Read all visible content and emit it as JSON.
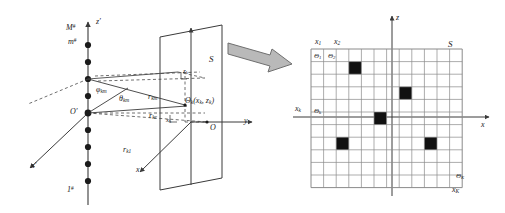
{
  "figure": {
    "background_color": "#ffffff",
    "line_color": "#3a3a3a",
    "text_color": "#1a1a1a",
    "cell_fill_color": "#111111",
    "arrow_fill_color": "#b9b9b9",
    "arrow_stroke_color": "#6f6f6f"
  },
  "left_panel": {
    "name": "array-geometry-diagram",
    "axes": [
      {
        "id": "z-prime-axis",
        "label": "z'",
        "direction": "up"
      },
      {
        "id": "x-prime-axis",
        "label": "x'",
        "direction": "down-left"
      },
      {
        "id": "y-axis",
        "label": "y",
        "direction": "right"
      },
      {
        "id": "z-axis",
        "label": "z",
        "direction": "up"
      },
      {
        "id": "x-axis",
        "label": "x",
        "direction": "down-left"
      }
    ],
    "origins": [
      {
        "id": "array-origin",
        "label": "O'"
      },
      {
        "id": "plane-origin",
        "label": "O"
      }
    ],
    "array": {
      "top_label": "M#",
      "element_label": "m#",
      "bottom_label": "1#",
      "element_count": 11
    },
    "plane_label": "S",
    "target_point_label": "Θk(xk, zk)",
    "target_point_theta": "Θ",
    "target_point_sub": "k",
    "target_point_coords": "(x",
    "angles": [
      {
        "id": "phi-km",
        "label": "φkm"
      },
      {
        "id": "theta-km",
        "label": "θkm"
      }
    ],
    "ranges": [
      {
        "id": "r-km",
        "label": "rkm"
      },
      {
        "id": "r-kc",
        "label": "rkc"
      },
      {
        "id": "r-k1",
        "label": "rk1"
      }
    ],
    "projections": [
      {
        "id": "z-k-projection",
        "label": "zk"
      },
      {
        "id": "x-k-projection",
        "label": "xk"
      }
    ]
  },
  "connector": {
    "name": "expand-arrow",
    "kind": "block-arrow",
    "direction": "down-right"
  },
  "right_panel": {
    "name": "discretized-grid-diagram",
    "grid": {
      "columns": 12,
      "rows": 11,
      "label": "S"
    },
    "axes": [
      {
        "id": "grid-z-axis",
        "label": "z",
        "direction": "up"
      },
      {
        "id": "grid-x-axis",
        "label": "x",
        "direction": "right"
      }
    ],
    "column_labels_top": [
      "x1",
      "x2"
    ],
    "column_label_bottom": "xK",
    "row_label_left": "xk",
    "cell_labels": [
      {
        "id": "theta-1",
        "label": "Θ1",
        "col": 0,
        "row": 0
      },
      {
        "id": "theta-2",
        "label": "Θ2",
        "col": 1,
        "row": 0
      },
      {
        "id": "theta-k",
        "label": "Θk",
        "col": 0,
        "row": 4
      },
      {
        "id": "theta-K",
        "label": "ΘK",
        "col": 11,
        "row": 10
      }
    ],
    "filled_cells": [
      {
        "col": 3,
        "row": 1
      },
      {
        "col": 7,
        "row": 3
      },
      {
        "col": 5,
        "row": 5
      },
      {
        "col": 2,
        "row": 7
      },
      {
        "col": 9,
        "row": 7
      }
    ]
  }
}
